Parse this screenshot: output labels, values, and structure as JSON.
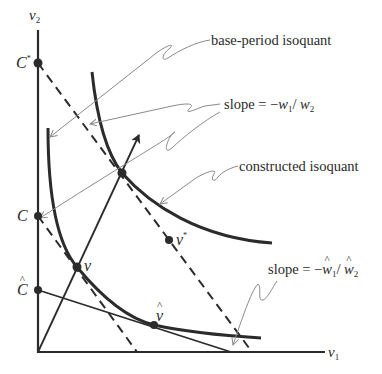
{
  "figure": {
    "axes": {
      "y_label_base": "v",
      "y_label_sub": "2",
      "x_label_base": "v",
      "x_label_sub": "1"
    },
    "points": {
      "c_star": {
        "base": "C",
        "sup": "*"
      },
      "c": {
        "base": "C"
      },
      "c_hat": {
        "base": "C"
      },
      "v": {
        "base": "v"
      },
      "v_hat": {
        "base": "v"
      },
      "v_star": {
        "base": "v",
        "sup": "*"
      }
    },
    "annotations": {
      "base_period_isoquant": "base-period isoquant",
      "constructed_isoquant": "constructed isoquant",
      "slope_w": {
        "prefix": "slope = −",
        "w1": "w",
        "w1_sub": "1",
        "sep": "/ ",
        "w2": "w",
        "w2_sub": "2"
      },
      "slope_w_hat": {
        "prefix": "slope = −",
        "w1": "w",
        "w1_sub": "1",
        "sep": "/ ",
        "w2": "w",
        "w2_sub": "2"
      }
    },
    "colors": {
      "curve": "#2b2b2b",
      "leader": "#8a8a8a",
      "text": "#2a2a2a"
    }
  }
}
